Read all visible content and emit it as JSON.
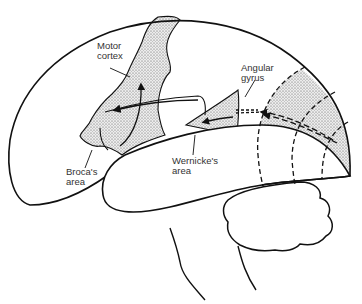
{
  "diagram": {
    "labels": {
      "motor_cortex": [
        "Motor",
        "cortex"
      ],
      "angular_gyrus": [
        "Angular",
        "gyrus"
      ],
      "brocas_area": [
        "Broca's",
        "area"
      ],
      "wernickes_area": [
        "Wernicke's",
        "area"
      ]
    },
    "colors": {
      "outline": "#111111",
      "stipple_fill": "#d9d9d9",
      "text": "#333333",
      "background": "#ffffff"
    }
  }
}
